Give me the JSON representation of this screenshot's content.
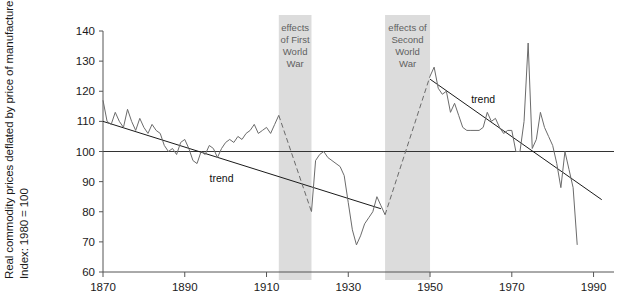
{
  "figure": {
    "ylabel_line1": "Real commodity prices deflated by price of manufactures",
    "ylabel_line2": "Index: 1980 = 100",
    "caption": "Figure 1.1  Terms of trade of developing countries, 1870–1990",
    "trend_label_left": "trend",
    "trend_label_right": "trend",
    "band1_label": [
      "effects",
      "of First",
      "World",
      "War"
    ],
    "band2_label": [
      "effects of",
      "Second",
      "World",
      "War"
    ],
    "colors": {
      "line": "#6b6b6b",
      "trend": "#1a1a1a",
      "band": "#dcdcdc",
      "axis": "#555555",
      "baseline": "#333333",
      "text": "#1a1a1a",
      "band_text": "#5f5f5f",
      "background": "#ffffff"
    }
  },
  "chart_data": {
    "type": "line",
    "title": "",
    "xlabel": "",
    "ylabel": "Real commodity prices deflated by price of manufactures, Index: 1980 = 100",
    "xlim": [
      1870,
      1995
    ],
    "ylim": [
      60,
      140
    ],
    "ytick_values": [
      60,
      70,
      80,
      90,
      100,
      110,
      120,
      130,
      140
    ],
    "xtick_values": [
      1870,
      1890,
      1910,
      1930,
      1950,
      1970,
      1990
    ],
    "grid": false,
    "legend": "none",
    "reference_line": {
      "y": 100,
      "label": ""
    },
    "shaded_bands": [
      {
        "name": "effects of First World War",
        "x0": 1913,
        "x1": 1921
      },
      {
        "name": "effects of Second World War",
        "x0": 1939,
        "x1": 1950
      }
    ],
    "annotations": [
      {
        "text": "trend",
        "x": 1899,
        "y": 90
      },
      {
        "text": "trend",
        "x": 1963,
        "y": 116
      }
    ],
    "series": [
      {
        "name": "Real commodity price index",
        "style": "solid",
        "x": [
          1870,
          1871,
          1872,
          1873,
          1874,
          1875,
          1876,
          1877,
          1878,
          1879,
          1880,
          1881,
          1882,
          1883,
          1884,
          1885,
          1886,
          1887,
          1888,
          1889,
          1890,
          1891,
          1892,
          1893,
          1894,
          1895,
          1896,
          1897,
          1898,
          1899,
          1900,
          1901,
          1902,
          1903,
          1904,
          1905,
          1906,
          1907,
          1908,
          1909,
          1910,
          1911,
          1912,
          1913
        ],
        "values": [
          117,
          110,
          109,
          113,
          110,
          108,
          114,
          110,
          107,
          111,
          108,
          106,
          109,
          107,
          106,
          102,
          100,
          101,
          99,
          103,
          104,
          101,
          97,
          96,
          100,
          99,
          102,
          101,
          98,
          101,
          103,
          104,
          103,
          105,
          104,
          106,
          107,
          109,
          106,
          107,
          108,
          106,
          109,
          112
        ]
      },
      {
        "name": "First World War effect",
        "style": "dashed",
        "x": [
          1913,
          1921
        ],
        "values": [
          112,
          80
        ]
      },
      {
        "name": "Inter-war index",
        "style": "solid",
        "x": [
          1921,
          1922,
          1923,
          1924,
          1925,
          1926,
          1927,
          1928,
          1929,
          1930,
          1931,
          1932,
          1933,
          1934,
          1935,
          1936,
          1937,
          1938,
          1939
        ],
        "values": [
          80,
          97,
          99,
          100,
          98,
          97,
          96,
          95,
          92,
          83,
          74,
          69,
          72,
          76,
          78,
          80,
          85,
          82,
          79
        ]
      },
      {
        "name": "Second World War effect",
        "style": "dashed",
        "x": [
          1939,
          1950
        ],
        "values": [
          79,
          125
        ]
      },
      {
        "name": "Post-war index",
        "style": "solid",
        "x": [
          1950,
          1951,
          1952,
          1953,
          1954,
          1955,
          1956,
          1957,
          1958,
          1959,
          1960,
          1961,
          1962,
          1963,
          1964,
          1965,
          1966,
          1967,
          1968,
          1969,
          1970,
          1971,
          1972,
          1973,
          1974,
          1975,
          1976,
          1977,
          1978,
          1979,
          1980,
          1981,
          1982,
          1983,
          1984,
          1985,
          1986
        ],
        "values": [
          125,
          128,
          121,
          119,
          120,
          113,
          116,
          112,
          108,
          107,
          107,
          107,
          107,
          108,
          113,
          110,
          111,
          108,
          106,
          107,
          107,
          100,
          100,
          110,
          136,
          101,
          104,
          113,
          108,
          105,
          102,
          96,
          88,
          100,
          94,
          88,
          69
        ]
      }
    ],
    "trend_lines": [
      {
        "name": "trend-1870-1938",
        "x": [
          1870,
          1938
        ],
        "values": [
          110,
          81
        ]
      },
      {
        "name": "trend-1950-1992",
        "x": [
          1950,
          1992
        ],
        "values": [
          124,
          84
        ]
      }
    ]
  }
}
